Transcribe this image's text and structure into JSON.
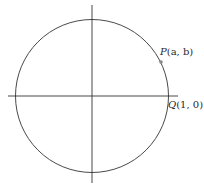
{
  "diagram": {
    "type": "unit-circle",
    "center": [
      92,
      96
    ],
    "radius": 76,
    "x_axis": {
      "from": 8,
      "to": 178,
      "y": 96
    },
    "y_axis": {
      "from": 5,
      "to": 183,
      "x": 92
    },
    "colors": {
      "stroke": "#333333",
      "point": "#888888",
      "text": "#2a2a2a"
    },
    "points": [
      {
        "id": "P",
        "name": "P",
        "coords": "(a, b)",
        "label": "P(a, b)",
        "x": 161,
        "y": 61
      },
      {
        "id": "Q",
        "name": "Q",
        "coords": "(1, 0)",
        "label": "Q(1, 0)",
        "x": 168,
        "y": 96
      }
    ]
  }
}
